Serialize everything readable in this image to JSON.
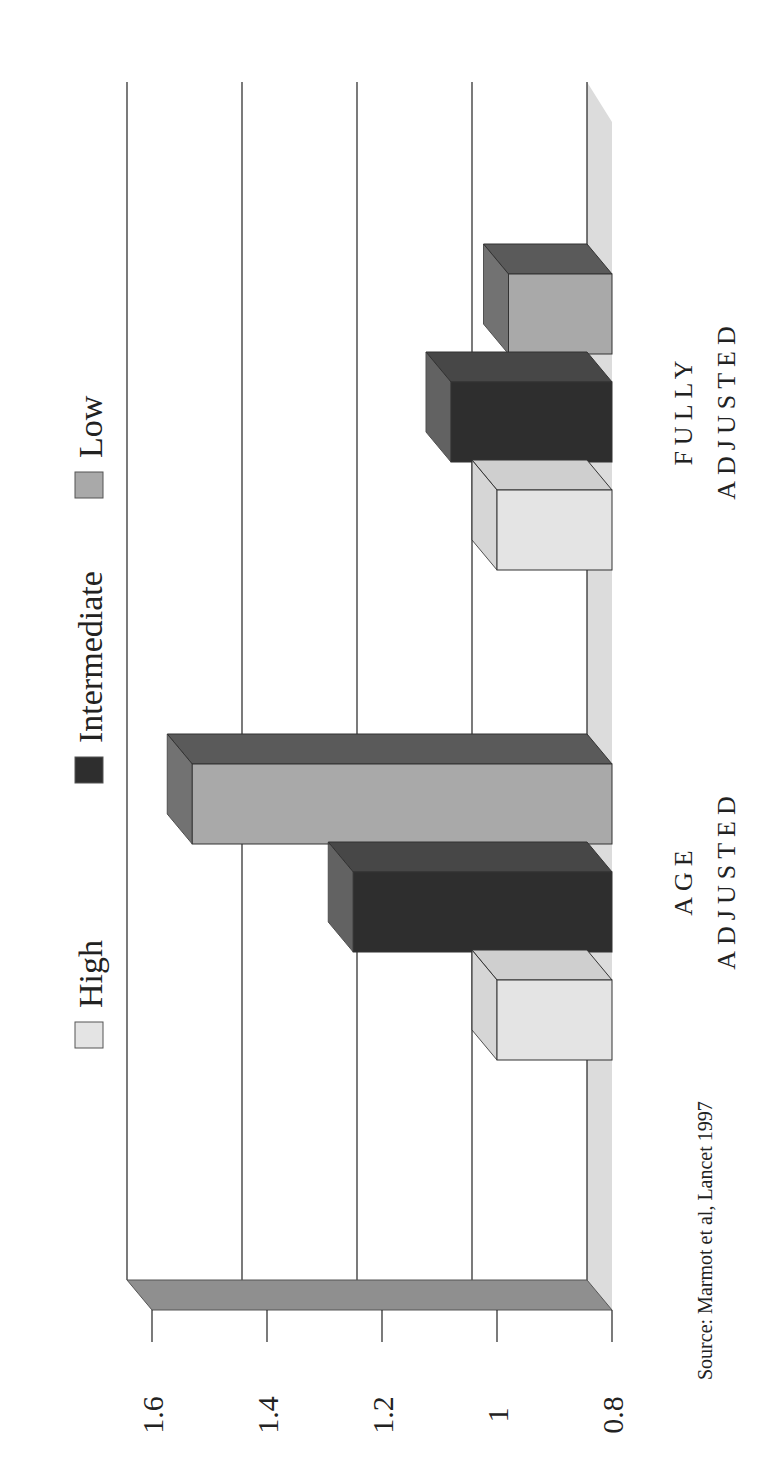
{
  "chart_data": {
    "type": "bar",
    "orientation": "3d-column-rotated-90-ccw",
    "title": "",
    "xlabel": "",
    "ylabel": "",
    "ylim": [
      0.8,
      1.6
    ],
    "yticks": [
      "0.8",
      "1",
      "1.2",
      "1.4",
      "1.6"
    ],
    "ytick_values": [
      0.8,
      1.0,
      1.2,
      1.4,
      1.6
    ],
    "categories": [
      "AGE ADJUSTED",
      "FULLY ADJUSTED"
    ],
    "category_lines": [
      [
        "AGE",
        "ADJUSTED"
      ],
      [
        "FULLY",
        "ADJUSTED"
      ]
    ],
    "series": [
      {
        "name": "High",
        "values": [
          1.0,
          1.0
        ],
        "color": "#e4e4e4"
      },
      {
        "name": "Intermediate",
        "values": [
          1.25,
          1.08
        ],
        "color": "#2e2e2e"
      },
      {
        "name": "Low",
        "values": [
          1.53,
          0.98
        ],
        "color": "#a9a9a9"
      }
    ],
    "legend_position": "top",
    "grid": true,
    "source": "Source: Marmot et al, Lancet 1997"
  },
  "colors": {
    "wall": "#8f8f8f",
    "floor": "#dcdcdc",
    "high_top": "#cfcfcf",
    "intermediate_top": "#474747",
    "low_top": "#5a5a5a"
  }
}
